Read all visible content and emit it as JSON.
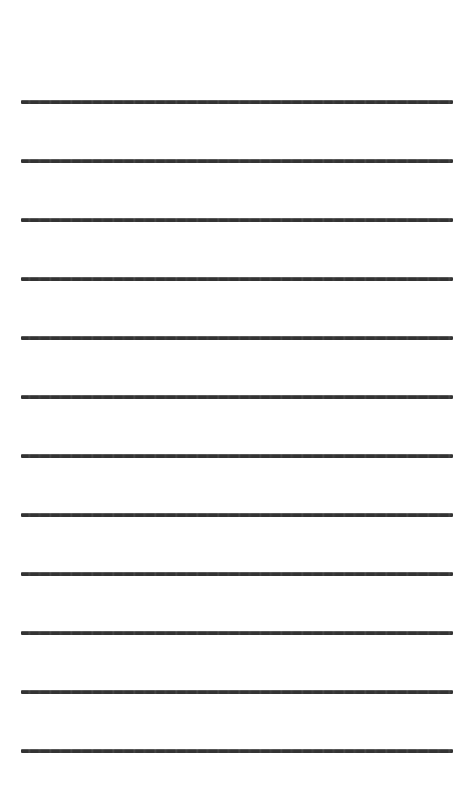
{
  "document": {
    "kind": "ruled-writing-paper",
    "title": "Blank Ruled Paper Sheet",
    "orientation": "portrait",
    "page_width": 474,
    "page_height": 794,
    "background_color": "#ffffff",
    "line_color": "#333333",
    "line_count": 12,
    "line_thickness": 4,
    "line_left": 21,
    "line_right": 453,
    "line_length": 432,
    "first_line_y": 100,
    "line_spacing": 59,
    "margin_left": 21,
    "margin_right": 21,
    "margin_top": 100,
    "margin_bottom": 40,
    "has_text": false,
    "has_vertical_margin_rule": false,
    "has_holes": false,
    "lines": [
      {
        "index": 1,
        "y": 100
      },
      {
        "index": 2,
        "y": 159
      },
      {
        "index": 3,
        "y": 218
      },
      {
        "index": 4,
        "y": 277
      },
      {
        "index": 5,
        "y": 336
      },
      {
        "index": 6,
        "y": 395
      },
      {
        "index": 7,
        "y": 454
      },
      {
        "index": 8,
        "y": 513
      },
      {
        "index": 9,
        "y": 572
      },
      {
        "index": 10,
        "y": 631
      },
      {
        "index": 11,
        "y": 690
      },
      {
        "index": 12,
        "y": 749
      }
    ]
  }
}
